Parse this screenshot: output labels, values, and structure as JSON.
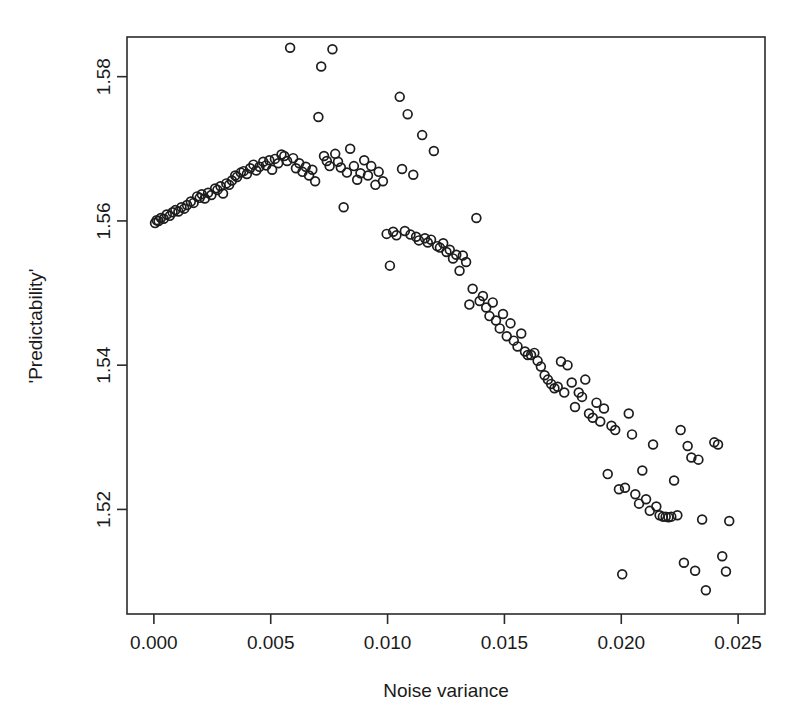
{
  "chart_data": {
    "type": "scatter",
    "title": "",
    "xlabel": "Noise variance",
    "ylabel": "'Predictability'",
    "xlim": [
      -0.00115,
      0.02615
    ],
    "ylim": [
      1.5055,
      1.5855
    ],
    "xticks": [
      0.0,
      0.005,
      0.01,
      0.015,
      0.02,
      0.025
    ],
    "xticklabels": [
      "0.000",
      "0.005",
      "0.010",
      "0.015",
      "0.020",
      "0.025"
    ],
    "yticks": [
      1.52,
      1.54,
      1.56,
      1.58
    ],
    "yticklabels": [
      "1.52",
      "1.54",
      "1.56",
      "1.58"
    ],
    "grid": false,
    "legend": null,
    "marker": "open-circle",
    "marker_color": "#1d1d1d",
    "marker_radius_px": 4.4,
    "points": [
      [
        5e-05,
        1.5597
      ],
      [
        0.00012,
        1.5601
      ],
      [
        0.0002,
        1.56
      ],
      [
        0.0003,
        1.5604
      ],
      [
        0.00042,
        1.5603
      ],
      [
        0.00055,
        1.5609
      ],
      [
        0.00068,
        1.5607
      ],
      [
        0.0008,
        1.5612
      ],
      [
        0.00092,
        1.5615
      ],
      [
        0.00105,
        1.5613
      ],
      [
        0.00118,
        1.5619
      ],
      [
        0.0013,
        1.5617
      ],
      [
        0.00142,
        1.5622
      ],
      [
        0.00158,
        1.5627
      ],
      [
        0.0017,
        1.5625
      ],
      [
        0.00185,
        1.5634
      ],
      [
        0.00196,
        1.5632
      ],
      [
        0.00205,
        1.5637
      ],
      [
        0.00218,
        1.5631
      ],
      [
        0.00232,
        1.5639
      ],
      [
        0.00246,
        1.5636
      ],
      [
        0.00262,
        1.5645
      ],
      [
        0.00272,
        1.5643
      ],
      [
        0.00285,
        1.5648
      ],
      [
        0.00296,
        1.5638
      ],
      [
        0.0031,
        1.5652
      ],
      [
        0.00322,
        1.565
      ],
      [
        0.00334,
        1.5656
      ],
      [
        0.00348,
        1.5663
      ],
      [
        0.00356,
        1.5661
      ],
      [
        0.00372,
        1.5667
      ],
      [
        0.00384,
        1.5669
      ],
      [
        0.00398,
        1.5665
      ],
      [
        0.00412,
        1.5673
      ],
      [
        0.00426,
        1.5678
      ],
      [
        0.00438,
        1.567
      ],
      [
        0.00452,
        1.5675
      ],
      [
        0.00468,
        1.5682
      ],
      [
        0.0048,
        1.5677
      ],
      [
        0.00494,
        1.5684
      ],
      [
        0.00506,
        1.5671
      ],
      [
        0.00518,
        1.5686
      ],
      [
        0.00532,
        1.568
      ],
      [
        0.00546,
        1.5692
      ],
      [
        0.00558,
        1.569
      ],
      [
        0.0057,
        1.5683
      ],
      [
        0.00583,
        1.584
      ],
      [
        0.00596,
        1.5687
      ],
      [
        0.00608,
        1.5673
      ],
      [
        0.00622,
        1.568
      ],
      [
        0.00636,
        1.5668
      ],
      [
        0.0065,
        1.5675
      ],
      [
        0.00664,
        1.5663
      ],
      [
        0.00678,
        1.5671
      ],
      [
        0.0069,
        1.5655
      ],
      [
        0.00704,
        1.5744
      ],
      [
        0.00716,
        1.5814
      ],
      [
        0.00728,
        1.569
      ],
      [
        0.0074,
        1.5683
      ],
      [
        0.00752,
        1.5676
      ],
      [
        0.00764,
        1.5838
      ],
      [
        0.00776,
        1.5693
      ],
      [
        0.00788,
        1.5682
      ],
      [
        0.008,
        1.5674
      ],
      [
        0.00812,
        1.5619
      ],
      [
        0.00826,
        1.5667
      ],
      [
        0.0084,
        1.57
      ],
      [
        0.00856,
        1.5676
      ],
      [
        0.0087,
        1.5657
      ],
      [
        0.00884,
        1.5666
      ],
      [
        0.009,
        1.5684
      ],
      [
        0.00916,
        1.5663
      ],
      [
        0.0093,
        1.5676
      ],
      [
        0.00948,
        1.565
      ],
      [
        0.00962,
        1.5668
      ],
      [
        0.0098,
        1.5655
      ],
      [
        0.00996,
        1.5582
      ],
      [
        0.0101,
        1.5538
      ],
      [
        0.01024,
        1.5585
      ],
      [
        0.01038,
        1.558
      ],
      [
        0.01052,
        1.5772
      ],
      [
        0.01062,
        1.5672
      ],
      [
        0.01074,
        1.5586
      ],
      [
        0.01086,
        1.5748
      ],
      [
        0.01098,
        1.5581
      ],
      [
        0.0111,
        1.5664
      ],
      [
        0.01122,
        1.5578
      ],
      [
        0.01134,
        1.5573
      ],
      [
        0.01148,
        1.5719
      ],
      [
        0.0116,
        1.5576
      ],
      [
        0.01172,
        1.557
      ],
      [
        0.01186,
        1.5574
      ],
      [
        0.01198,
        1.5697
      ],
      [
        0.01212,
        1.5565
      ],
      [
        0.01224,
        1.5563
      ],
      [
        0.01238,
        1.5569
      ],
      [
        0.01252,
        1.5557
      ],
      [
        0.01266,
        1.556
      ],
      [
        0.0128,
        1.5548
      ],
      [
        0.01294,
        1.5553
      ],
      [
        0.01308,
        1.5531
      ],
      [
        0.01322,
        1.5552
      ],
      [
        0.01336,
        1.5543
      ],
      [
        0.0135,
        1.5484
      ],
      [
        0.01364,
        1.5506
      ],
      [
        0.0138,
        1.5604
      ],
      [
        0.01394,
        1.5489
      ],
      [
        0.01408,
        1.5496
      ],
      [
        0.01422,
        1.548
      ],
      [
        0.01436,
        1.5468
      ],
      [
        0.0145,
        1.5487
      ],
      [
        0.01464,
        1.5462
      ],
      [
        0.0148,
        1.5451
      ],
      [
        0.01494,
        1.5471
      ],
      [
        0.0151,
        1.544
      ],
      [
        0.01526,
        1.5458
      ],
      [
        0.0154,
        1.5434
      ],
      [
        0.01556,
        1.5426
      ],
      [
        0.01572,
        1.5444
      ],
      [
        0.01588,
        1.5419
      ],
      [
        0.016,
        1.5414
      ],
      [
        0.01614,
        1.5414
      ],
      [
        0.01628,
        1.5417
      ],
      [
        0.01642,
        1.5406
      ],
      [
        0.01656,
        1.5398
      ],
      [
        0.01672,
        1.5386
      ],
      [
        0.01686,
        1.538
      ],
      [
        0.017,
        1.5374
      ],
      [
        0.01714,
        1.5368
      ],
      [
        0.01728,
        1.537
      ],
      [
        0.01742,
        1.5405
      ],
      [
        0.01756,
        1.5362
      ],
      [
        0.0177,
        1.54
      ],
      [
        0.01788,
        1.5376
      ],
      [
        0.01802,
        1.5342
      ],
      [
        0.01818,
        1.5362
      ],
      [
        0.01832,
        1.5356
      ],
      [
        0.01846,
        1.538
      ],
      [
        0.01862,
        1.5333
      ],
      [
        0.01878,
        1.5327
      ],
      [
        0.01894,
        1.5348
      ],
      [
        0.0191,
        1.5322
      ],
      [
        0.01926,
        1.534
      ],
      [
        0.01942,
        1.5249
      ],
      [
        0.01958,
        1.5316
      ],
      [
        0.01974,
        1.531
      ],
      [
        0.0199,
        1.5228
      ],
      [
        0.02004,
        1.511
      ],
      [
        0.02016,
        1.523
      ],
      [
        0.02032,
        1.5333
      ],
      [
        0.02046,
        1.5304
      ],
      [
        0.0206,
        1.5221
      ],
      [
        0.02076,
        1.5208
      ],
      [
        0.0209,
        1.5254
      ],
      [
        0.02106,
        1.5214
      ],
      [
        0.02122,
        1.5198
      ],
      [
        0.02136,
        1.529
      ],
      [
        0.0215,
        1.5204
      ],
      [
        0.02164,
        1.5192
      ],
      [
        0.02178,
        1.519
      ],
      [
        0.0219,
        1.519
      ],
      [
        0.02202,
        1.5189
      ],
      [
        0.02214,
        1.519
      ],
      [
        0.02226,
        1.524
      ],
      [
        0.0224,
        1.5192
      ],
      [
        0.02254,
        1.531
      ],
      [
        0.02268,
        1.5126
      ],
      [
        0.02284,
        1.5288
      ],
      [
        0.023,
        1.5272
      ],
      [
        0.02316,
        1.5115
      ],
      [
        0.0233,
        1.5269
      ],
      [
        0.02346,
        1.5186
      ],
      [
        0.02362,
        1.5088
      ],
      [
        0.02398,
        1.5293
      ],
      [
        0.02414,
        1.529
      ],
      [
        0.02432,
        1.5135
      ],
      [
        0.02448,
        1.5114
      ],
      [
        0.02462,
        1.5184
      ]
    ]
  },
  "axes": {
    "x_tick_label_0": "0.000",
    "x_tick_label_1": "0.005",
    "x_tick_label_2": "0.010",
    "x_tick_label_3": "0.015",
    "x_tick_label_4": "0.020",
    "x_tick_label_5": "0.025",
    "y_tick_label_0": "1.52",
    "y_tick_label_1": "1.54",
    "y_tick_label_2": "1.56",
    "y_tick_label_3": "1.58",
    "x_axis_title": "Noise variance",
    "y_axis_title": "'Predictability'"
  }
}
